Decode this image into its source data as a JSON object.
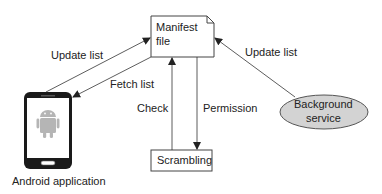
{
  "diagram": {
    "nodes": {
      "manifest": {
        "line1": "Manifest",
        "line2": "file"
      },
      "scrambling": {
        "label": "Scrambling"
      },
      "background": {
        "line1": "Background",
        "line2": "service"
      },
      "android": {
        "label": "Android application"
      }
    },
    "edges": {
      "update_list_left": "Update list",
      "fetch_list": "Fetch list",
      "check": "Check",
      "permission": "Permission",
      "update_list_right": "Update list"
    },
    "colors": {
      "stroke": "#333333",
      "background_fill": "#d3d3d3",
      "phone_body": "#1a1a1a",
      "android_icon": "#b5b5b5"
    }
  }
}
